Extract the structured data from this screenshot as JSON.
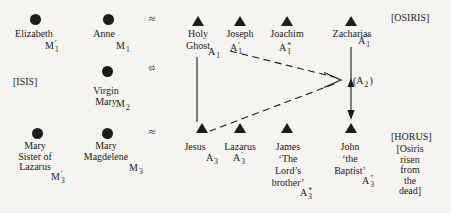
{
  "colors": {
    "background": "#f5f4f0",
    "ink": "#1b1b1b"
  },
  "relations": {
    "approx_top": "≈",
    "approx_middle": "≈",
    "approx_bottom": "≈",
    "a2": {
      "prefix": "(",
      "base": "A",
      "sup": "",
      "sub": "2",
      "suffix": ")"
    }
  },
  "side_labels": {
    "osiris": "[OSIRIS]",
    "isis": "[ISIS]",
    "horus": "[HORUS]",
    "osiris_risen_lines": [
      "[Osiris",
      "risen",
      "from",
      "the",
      "dead]"
    ]
  },
  "persons": {
    "elizabeth": {
      "symbol": "female-circle",
      "name_lines": [
        "Elizabeth"
      ],
      "code": {
        "base": "M",
        "sup": "′",
        "sub": "1"
      }
    },
    "anne": {
      "symbol": "female-circle",
      "name_lines": [
        "Anne"
      ],
      "code": {
        "base": "M",
        "sup": "",
        "sub": "1"
      }
    },
    "holy_ghost": {
      "symbol": "male-triangle",
      "name_lines": [
        "Holy",
        "Ghost"
      ],
      "code": {
        "base": "A",
        "sup": "",
        "sub": "1"
      }
    },
    "joseph": {
      "symbol": "male-triangle",
      "name_lines": [
        "Joseph"
      ],
      "code": {
        "base": "A",
        "sup": "′",
        "sub": "1"
      }
    },
    "joachim": {
      "symbol": "male-triangle",
      "name_lines": [
        "Joachim"
      ],
      "code": {
        "base": "A",
        "sup": "*",
        "sub": "1"
      }
    },
    "zacharias": {
      "symbol": "male-triangle",
      "name_lines": [
        "Zacharias"
      ],
      "code": {
        "base": "A",
        "sup": "″",
        "sub": "1"
      }
    },
    "virgin_mary": {
      "symbol": "female-circle",
      "name_lines": [
        "Virgin",
        "Mary"
      ],
      "code": {
        "base": "M",
        "sup": "",
        "sub": "2"
      }
    },
    "mary_sister": {
      "symbol": "female-circle",
      "name_lines": [
        "Mary",
        "Sister of",
        "Lazarus"
      ],
      "code": {
        "base": "M",
        "sup": "′",
        "sub": "3"
      }
    },
    "mary_magdelene": {
      "symbol": "female-circle",
      "name_lines": [
        "Mary",
        "Magdelene"
      ],
      "code": {
        "base": "M",
        "sup": "",
        "sub": "3"
      }
    },
    "jesus": {
      "symbol": "male-triangle",
      "name_lines": [
        "Jesus"
      ],
      "code": {
        "base": "A",
        "sup": "",
        "sub": "3"
      }
    },
    "lazarus": {
      "symbol": "male-triangle",
      "name_lines": [
        "Lazarus"
      ],
      "code": {
        "base": "A",
        "sup": "′",
        "sub": "3"
      }
    },
    "james": {
      "symbol": "male-triangle",
      "name_lines": [
        "James",
        "‘The",
        "Lord’s",
        "brother’"
      ],
      "code": {
        "base": "A",
        "sup": "*",
        "sub": "3"
      }
    },
    "john": {
      "symbol": "male-triangle",
      "name_lines": [
        "John",
        "‘the",
        "Baptist’"
      ],
      "code": {
        "base": "A",
        "sup": "″",
        "sub": "3"
      }
    }
  }
}
